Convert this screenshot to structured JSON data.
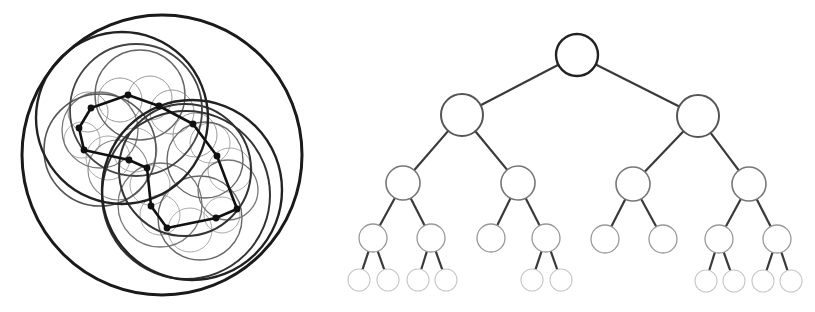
{
  "figure": {
    "panels": [
      {
        "id": "circle-packing",
        "description": "Hierarchical circle packing of a polygonal path: a chain of points connected by a thick polyline, enclosed by nested circles of decreasing stroke weight",
        "polyline": {
          "stroke": "#111111",
          "width": 2.6,
          "closed": true,
          "points": [
            [
              128,
              95
            ],
            [
              159,
              106
            ],
            [
              193,
              124
            ],
            [
              217,
              156
            ],
            [
              237,
              209
            ],
            [
              216,
              218
            ],
            [
              167,
              228
            ],
            [
              151,
              206
            ],
            [
              147,
              168
            ],
            [
              129,
              160
            ],
            [
              84,
              150
            ],
            [
              79,
              128
            ],
            [
              91,
              108
            ]
          ]
        },
        "circles": [
          {
            "cx": 162,
            "cy": 155,
            "r": 140,
            "stroke": "#1a1a1a",
            "w": 3.0
          },
          {
            "cx": 122,
            "cy": 118,
            "r": 86,
            "stroke": "#222222",
            "w": 2.4
          },
          {
            "cx": 192,
            "cy": 190,
            "r": 90,
            "stroke": "#222222",
            "w": 2.4
          },
          {
            "cx": 186,
            "cy": 195,
            "r": 84,
            "stroke": "#333333",
            "w": 2.0
          },
          {
            "cx": 136,
            "cy": 110,
            "r": 66,
            "stroke": "#444444",
            "w": 1.8
          },
          {
            "cx": 185,
            "cy": 170,
            "r": 66,
            "stroke": "#333333",
            "w": 2.0
          },
          {
            "cx": 100,
            "cy": 150,
            "r": 56,
            "stroke": "#555555",
            "w": 1.6
          },
          {
            "cx": 140,
            "cy": 95,
            "r": 45,
            "stroke": "#666666",
            "w": 1.4
          },
          {
            "cx": 205,
            "cy": 160,
            "r": 38,
            "stroke": "#666666",
            "w": 1.4
          },
          {
            "cx": 228,
            "cy": 190,
            "r": 30,
            "stroke": "#777777",
            "w": 1.3
          },
          {
            "cx": 200,
            "cy": 218,
            "r": 42,
            "stroke": "#666666",
            "w": 1.4
          },
          {
            "cx": 160,
            "cy": 205,
            "r": 42,
            "stroke": "#777777",
            "w": 1.3
          },
          {
            "cx": 100,
            "cy": 130,
            "r": 38,
            "stroke": "#777777",
            "w": 1.3
          },
          {
            "cx": 118,
            "cy": 170,
            "r": 30,
            "stroke": "#888888",
            "w": 1.1
          },
          {
            "cx": 120,
            "cy": 100,
            "r": 22,
            "stroke": "#999999",
            "w": 1.0
          },
          {
            "cx": 150,
            "cy": 98,
            "r": 22,
            "stroke": "#999999",
            "w": 1.0
          },
          {
            "cx": 172,
            "cy": 112,
            "r": 22,
            "stroke": "#999999",
            "w": 1.0
          },
          {
            "cx": 195,
            "cy": 135,
            "r": 22,
            "stroke": "#999999",
            "w": 1.0
          },
          {
            "cx": 88,
            "cy": 112,
            "r": 20,
            "stroke": "#999999",
            "w": 1.0
          },
          {
            "cx": 82,
            "cy": 140,
            "r": 18,
            "stroke": "#aaaaaa",
            "w": 1.0
          },
          {
            "cx": 108,
            "cy": 158,
            "r": 22,
            "stroke": "#aaaaaa",
            "w": 1.0
          },
          {
            "cx": 135,
            "cy": 150,
            "r": 22,
            "stroke": "#aaaaaa",
            "w": 1.0
          },
          {
            "cx": 150,
            "cy": 185,
            "r": 20,
            "stroke": "#aaaaaa",
            "w": 1.0
          },
          {
            "cx": 160,
            "cy": 215,
            "r": 20,
            "stroke": "#aaaaaa",
            "w": 1.0
          },
          {
            "cx": 190,
            "cy": 230,
            "r": 22,
            "stroke": "#aaaaaa",
            "w": 1.0
          },
          {
            "cx": 222,
            "cy": 215,
            "r": 18,
            "stroke": "#aaaaaa",
            "w": 1.0
          },
          {
            "cx": 230,
            "cy": 170,
            "r": 22,
            "stroke": "#aaaaaa",
            "w": 1.0
          },
          {
            "cx": 210,
            "cy": 143,
            "r": 20,
            "stroke": "#aaaaaa",
            "w": 1.0
          }
        ]
      },
      {
        "id": "binary-tree",
        "description": "Binary tree with node circles that shrink and fade with depth",
        "edge_stroke": "#3a3a3a",
        "levels": [
          {
            "r": 21,
            "stroke": "#222222",
            "w": 2.4
          },
          {
            "r": 21,
            "stroke": "#555555",
            "w": 2.0
          },
          {
            "r": 17,
            "stroke": "#777777",
            "w": 1.6
          },
          {
            "r": 14,
            "stroke": "#999999",
            "w": 1.3
          },
          {
            "r": 11,
            "stroke": "#c8c8c8",
            "w": 1.1
          }
        ],
        "nodes": [
          {
            "id": "n0",
            "x": 577,
            "y": 55,
            "level": 0
          },
          {
            "id": "n1",
            "x": 462,
            "y": 115,
            "level": 1,
            "parent": "n0"
          },
          {
            "id": "n2",
            "x": 698,
            "y": 116,
            "level": 1,
            "parent": "n0"
          },
          {
            "id": "n3",
            "x": 403,
            "y": 183,
            "level": 2,
            "parent": "n1"
          },
          {
            "id": "n4",
            "x": 518,
            "y": 183,
            "level": 2,
            "parent": "n1"
          },
          {
            "id": "n5",
            "x": 633,
            "y": 184,
            "level": 2,
            "parent": "n2"
          },
          {
            "id": "n6",
            "x": 749,
            "y": 184,
            "level": 2,
            "parent": "n2"
          },
          {
            "id": "n7",
            "x": 373,
            "y": 238,
            "level": 3,
            "parent": "n3"
          },
          {
            "id": "n8",
            "x": 431,
            "y": 238,
            "level": 3,
            "parent": "n3"
          },
          {
            "id": "n9",
            "x": 491,
            "y": 238,
            "level": 3,
            "parent": "n4"
          },
          {
            "id": "n10",
            "x": 546,
            "y": 238,
            "level": 3,
            "parent": "n4"
          },
          {
            "id": "n11",
            "x": 605,
            "y": 239,
            "level": 3,
            "parent": "n5"
          },
          {
            "id": "n12",
            "x": 663,
            "y": 239,
            "level": 3,
            "parent": "n5"
          },
          {
            "id": "n13",
            "x": 719,
            "y": 239,
            "level": 3,
            "parent": "n6"
          },
          {
            "id": "n14",
            "x": 777,
            "y": 239,
            "level": 3,
            "parent": "n6"
          },
          {
            "id": "n15",
            "x": 359,
            "y": 280,
            "level": 4,
            "parent": "n7"
          },
          {
            "id": "n16",
            "x": 388,
            "y": 280,
            "level": 4,
            "parent": "n7"
          },
          {
            "id": "n17",
            "x": 418,
            "y": 280,
            "level": 4,
            "parent": "n8"
          },
          {
            "id": "n18",
            "x": 446,
            "y": 280,
            "level": 4,
            "parent": "n8"
          },
          {
            "id": "n19",
            "x": 532,
            "y": 280,
            "level": 4,
            "parent": "n10"
          },
          {
            "id": "n20",
            "x": 561,
            "y": 280,
            "level": 4,
            "parent": "n10"
          },
          {
            "id": "n21",
            "x": 706,
            "y": 281,
            "level": 4,
            "parent": "n13"
          },
          {
            "id": "n22",
            "x": 734,
            "y": 281,
            "level": 4,
            "parent": "n13"
          },
          {
            "id": "n23",
            "x": 763,
            "y": 281,
            "level": 4,
            "parent": "n14"
          },
          {
            "id": "n24",
            "x": 791,
            "y": 281,
            "level": 4,
            "parent": "n14"
          }
        ]
      }
    ]
  }
}
